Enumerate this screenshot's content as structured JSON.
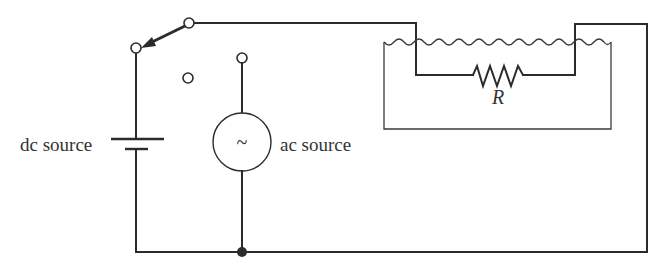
{
  "diagram": {
    "type": "circuit",
    "labels": {
      "dc_source": "dc source",
      "ac_source": "ac source",
      "resistor": "R",
      "ac_symbol": "~"
    },
    "components": [
      {
        "id": "dc-source",
        "kind": "battery",
        "label": "dc source"
      },
      {
        "id": "ac-source",
        "kind": "ac-generator",
        "label": "ac source"
      },
      {
        "id": "switch",
        "kind": "three-position-switch",
        "state": "connected to dc source"
      },
      {
        "id": "resistor",
        "kind": "resistor",
        "label": "R",
        "location": "immersed in liquid tank"
      },
      {
        "id": "tank",
        "kind": "liquid-container"
      },
      {
        "id": "junction",
        "kind": "node",
        "location": "bottom wire below ac source"
      }
    ],
    "colors": {
      "line": "#2b2b2b",
      "text": "#333333",
      "background": "#ffffff"
    }
  }
}
